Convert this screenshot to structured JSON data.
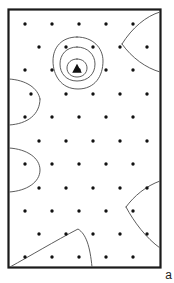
{
  "figure": {
    "panel_label": "a",
    "type": "contour-map",
    "frame": {
      "x": 8.5,
      "y": 9.5,
      "width": 152,
      "height": 258,
      "stroke_color": "#1a1a1a",
      "stroke_width": 2.2,
      "fill_color": "#ffffff"
    },
    "background_color": "#ffffff",
    "contour_color": "#4a4a4a",
    "contour_width": 0.9,
    "station_color": "#111111",
    "station_radius": 1.7,
    "marker": {
      "name": "triangle-marker",
      "x": 77,
      "y": 69,
      "size": 5.2,
      "color": "#111111"
    },
    "stations": [
      {
        "x": 25,
        "y": 24
      },
      {
        "x": 52,
        "y": 24
      },
      {
        "x": 79,
        "y": 24
      },
      {
        "x": 106,
        "y": 24
      },
      {
        "x": 133,
        "y": 24
      },
      {
        "x": 39,
        "y": 47
      },
      {
        "x": 66,
        "y": 47
      },
      {
        "x": 93,
        "y": 47
      },
      {
        "x": 120,
        "y": 47
      },
      {
        "x": 147,
        "y": 47
      },
      {
        "x": 25,
        "y": 70
      },
      {
        "x": 52,
        "y": 70
      },
      {
        "x": 79,
        "y": 70
      },
      {
        "x": 106,
        "y": 70
      },
      {
        "x": 133,
        "y": 70
      },
      {
        "x": 31,
        "y": 94
      },
      {
        "x": 66,
        "y": 94
      },
      {
        "x": 93,
        "y": 94
      },
      {
        "x": 120,
        "y": 94
      },
      {
        "x": 147,
        "y": 94
      },
      {
        "x": 25,
        "y": 117
      },
      {
        "x": 52,
        "y": 117
      },
      {
        "x": 79,
        "y": 117
      },
      {
        "x": 106,
        "y": 117
      },
      {
        "x": 133,
        "y": 117
      },
      {
        "x": 39,
        "y": 141
      },
      {
        "x": 66,
        "y": 141
      },
      {
        "x": 93,
        "y": 141
      },
      {
        "x": 120,
        "y": 141
      },
      {
        "x": 147,
        "y": 141
      },
      {
        "x": 25,
        "y": 164
      },
      {
        "x": 52,
        "y": 164
      },
      {
        "x": 79,
        "y": 164
      },
      {
        "x": 106,
        "y": 164
      },
      {
        "x": 133,
        "y": 164
      },
      {
        "x": 39,
        "y": 188
      },
      {
        "x": 66,
        "y": 188
      },
      {
        "x": 93,
        "y": 188
      },
      {
        "x": 120,
        "y": 188
      },
      {
        "x": 147,
        "y": 188
      },
      {
        "x": 25,
        "y": 211
      },
      {
        "x": 52,
        "y": 211
      },
      {
        "x": 79,
        "y": 211
      },
      {
        "x": 106,
        "y": 211
      },
      {
        "x": 133,
        "y": 211
      },
      {
        "x": 39,
        "y": 234
      },
      {
        "x": 66,
        "y": 234
      },
      {
        "x": 93,
        "y": 234
      },
      {
        "x": 120,
        "y": 234
      },
      {
        "x": 147,
        "y": 234
      },
      {
        "x": 25,
        "y": 257
      },
      {
        "x": 52,
        "y": 257
      },
      {
        "x": 79,
        "y": 257
      },
      {
        "x": 106,
        "y": 257
      },
      {
        "x": 133,
        "y": 257
      }
    ],
    "contours": [
      {
        "name": "center-closed-outer",
        "path": "M 77 37 C 93 37 103 48 103 61 C 103 76 95 89 78 89 C 61 89 53 75 53 61 C 53 47 62 37 77 37 Z"
      },
      {
        "name": "center-closed-middle",
        "path": "M 77 47 C 88 47 95 55 95 64 C 95 74 88 81 77 81 C 66 81 60 73 60 64 C 60 55 66 47 77 47 Z"
      },
      {
        "name": "center-closed-inner",
        "path": "M 77 59 C 83 59 87 63 87 68 C 87 73 83 77 77 77 C 71 77 67 73 67 68 C 67 63 71 59 77 59 Z"
      },
      {
        "name": "top-right-edge-lens-upper",
        "path": "M 160 12 C 146 16 132 28 122 44"
      },
      {
        "name": "top-right-edge-lens-lower",
        "path": "M 122 44 C 132 58 146 68 160 72"
      },
      {
        "name": "left-edge-bulge-upper",
        "path": "M 9 79 C 26 80 38 88 40 99"
      },
      {
        "name": "left-edge-bulge-lower",
        "path": "M 40 99 C 40 114 28 124 9 125"
      },
      {
        "name": "left-edge-bulge2",
        "path": "M 9 148 C 27 149 40 158 40 170 C 40 182 27 191 9 192"
      },
      {
        "name": "bottom-right-edge-lens-upper",
        "path": "M 160 181 C 146 186 134 196 126 207"
      },
      {
        "name": "bottom-right-edge-lens-lower",
        "path": "M 126 207 C 134 222 146 238 160 248"
      },
      {
        "name": "bottom-left-ridge",
        "path": "M 10 267 C 30 256 55 241 78 229 C 86 234 90 246 92 267"
      }
    ]
  }
}
